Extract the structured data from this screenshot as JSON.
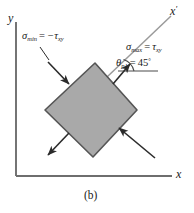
{
  "figure": {
    "caption": "(b)",
    "axes": {
      "y_label": "y",
      "x_label": "x",
      "x_prime_label": "x",
      "x_prime_mark": "′"
    },
    "labels": {
      "sigma_min": {
        "symbol": "σ",
        "subscript": "min",
        "equals": "=",
        "value": "−τ",
        "value_subscript": "xy",
        "full_text": "σmin = −τxy"
      },
      "sigma_max": {
        "symbol": "σ",
        "subscript": "max",
        "equals": "=",
        "value": "τ",
        "value_subscript": "xy",
        "full_text": "σmax = τxy"
      },
      "theta_p1": {
        "symbol": "θ",
        "subscript": "p1",
        "equals": "=",
        "value": "45",
        "degree": "°",
        "full_text": "θp1 = 45°"
      }
    },
    "element": {
      "shape": "rotated-square-diamond",
      "rotation_deg": 45,
      "fill_color": "#a9a9a9",
      "stroke_color": "#555555"
    },
    "arrows": {
      "tension_direction": "outward",
      "compression_direction": "inward",
      "color": "#2b2b2b"
    },
    "colors": {
      "axis": "#6e6e6e",
      "axis_prime": "#9a9a9a",
      "text": "#1a1a1a",
      "background": "#ffffff"
    }
  }
}
